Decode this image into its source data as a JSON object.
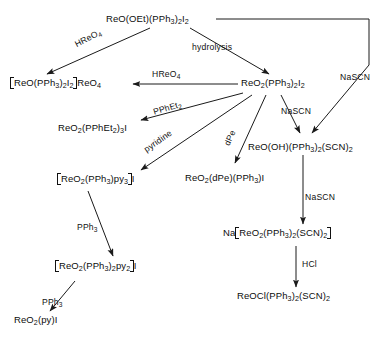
{
  "scheme": {
    "title": "Reaction scheme of oxorhenium phosphine complexes",
    "line_color": "#1a1a1a",
    "nodes": [
      {
        "id": "n1",
        "name": "reo-oet-pph3-i2",
        "text": "ReO(OEt)(PPh3)2I2"
      },
      {
        "id": "n2",
        "name": "reo-pph3-i2-reo4",
        "text": "[ReO(PPh3)2I2]ReO4"
      },
      {
        "id": "n3",
        "name": "reo2-pph3-i2",
        "text": "ReO2(PPh3)2I2"
      },
      {
        "id": "n4",
        "name": "reo2-pphet2-3-i",
        "text": "ReO2(PPhEt2)3I"
      },
      {
        "id": "n5",
        "name": "reo2-pph3-py3-i",
        "text": "[ReO2(PPh3)py3]I"
      },
      {
        "id": "n6",
        "name": "reo2-dpe-pph3-i",
        "text": "ReO2(dPe)(PPh3)I"
      },
      {
        "id": "n7",
        "name": "reo-oh-pph3-scn2",
        "text": "ReO(OH)(PPh3)2(SCN)2"
      },
      {
        "id": "n8",
        "name": "reo2-pph3-2-py2-i",
        "text": "[ReO2(PPh3)2py2]I"
      },
      {
        "id": "n9",
        "name": "na-reo2-pph3-scn2",
        "text": "Na[ReO2(PPh3)2(SCN)2]"
      },
      {
        "id": "n10",
        "name": "reo2-py-i",
        "text": "ReO2(py)I"
      },
      {
        "id": "n11",
        "name": "reocl-pph3-scn2",
        "text": "ReOCl(PPh3)2(SCN)2"
      }
    ],
    "reagents": [
      {
        "id": "r1",
        "name": "reagent-hreo4-diagonal",
        "text": "HReO4"
      },
      {
        "id": "r2",
        "name": "reagent-hydrolysis",
        "text": "hydrolysis"
      },
      {
        "id": "r3",
        "name": "reagent-nascn-right",
        "text": "NaSCN"
      },
      {
        "id": "r4",
        "name": "reagent-hreo4-horizontal",
        "text": "HReO4"
      },
      {
        "id": "r5",
        "name": "reagent-pphet2",
        "text": "PPhEt2"
      },
      {
        "id": "r6",
        "name": "reagent-pyridine",
        "text": "pyridine"
      },
      {
        "id": "r7",
        "name": "reagent-dpe",
        "text": "dPe"
      },
      {
        "id": "r8",
        "name": "reagent-nascn-center",
        "text": "NaSCN"
      },
      {
        "id": "r9",
        "name": "reagent-nascn-lower",
        "text": "NaSCN"
      },
      {
        "id": "r10",
        "name": "reagent-pph3-upper",
        "text": "PPh3"
      },
      {
        "id": "r11",
        "name": "reagent-pph3-lower",
        "text": "PPh3"
      },
      {
        "id": "r12",
        "name": "reagent-hcl",
        "text": "HCl"
      }
    ]
  }
}
